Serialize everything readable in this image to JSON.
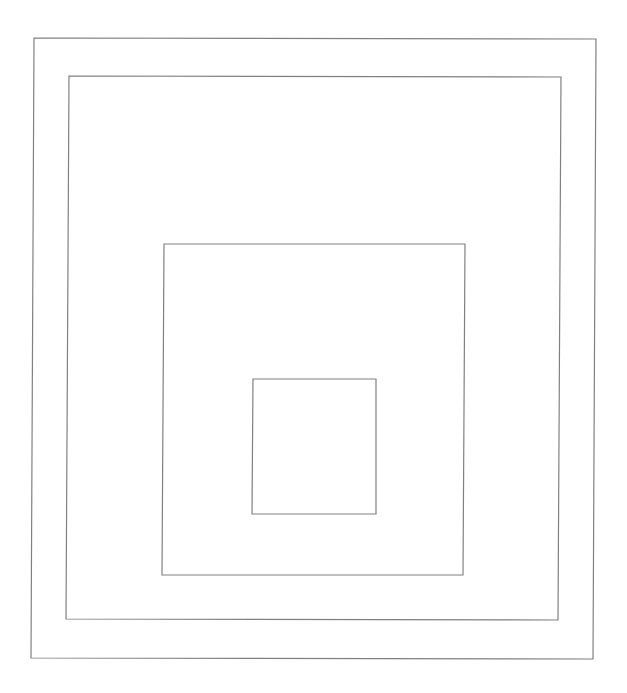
{
  "canvas": {
    "width": 627,
    "height": 693,
    "background": "#ffffff",
    "stroke_color": "#808080",
    "stroke_width": 1.2
  },
  "shapes": [
    {
      "name": "outer-square",
      "points": [
        [
          34,
          38
        ],
        [
          596,
          39
        ],
        [
          593,
          659
        ],
        [
          31,
          658
        ]
      ]
    },
    {
      "name": "second-square",
      "points": [
        [
          69,
          76
        ],
        [
          561,
          77
        ],
        [
          558,
          620
        ],
        [
          66,
          619
        ]
      ]
    },
    {
      "name": "third-square",
      "points": [
        [
          164,
          244
        ],
        [
          465,
          244
        ],
        [
          463,
          575
        ],
        [
          162,
          575
        ]
      ]
    },
    {
      "name": "inner-square",
      "points": [
        [
          253,
          379
        ],
        [
          376,
          379
        ],
        [
          376,
          514
        ],
        [
          252,
          514
        ]
      ]
    }
  ]
}
